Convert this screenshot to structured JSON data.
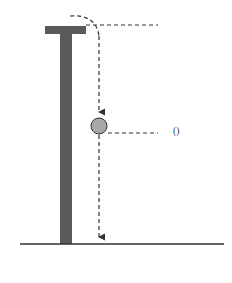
{
  "diagram": {
    "labels": {
      "top": {
        "var": "s",
        "eq": " = ",
        "val": "0"
      },
      "current": {
        "var": "s",
        "eq": " = ",
        "val_fn": "s",
        "val_arg": "t"
      }
    },
    "colors": {
      "tower": "#5a5a5a",
      "ball": "#a8a8a8",
      "ruler_gray": "#999999",
      "ruler_white": "#ffffff",
      "line": "#333333"
    },
    "ruler": {
      "segments": 12,
      "first_segment": "gray"
    }
  }
}
